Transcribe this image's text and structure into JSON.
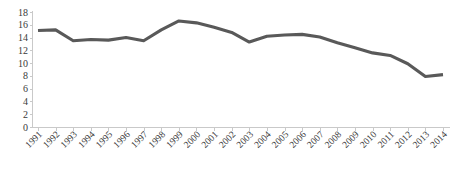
{
  "chart_data": {
    "type": "line",
    "title": "",
    "subtitle": "",
    "xlabel": "",
    "ylabel": "",
    "categories": [
      "1991",
      "1992",
      "1993",
      "1994",
      "1995",
      "1996",
      "1997",
      "1998",
      "1999",
      "2000",
      "2001",
      "2002",
      "2003",
      "2004",
      "2005",
      "2006",
      "2007",
      "2008",
      "2009",
      "2010",
      "2011",
      "2012",
      "2013",
      "2014"
    ],
    "series": [
      {
        "name": "",
        "color": "#595959",
        "values": [
          15.1,
          15.2,
          13.5,
          13.7,
          13.6,
          14.0,
          13.5,
          15.2,
          16.6,
          16.3,
          15.6,
          14.8,
          13.3,
          14.2,
          14.4,
          14.5,
          14.1,
          13.2,
          12.4,
          11.6,
          11.2,
          9.9,
          7.9,
          8.2
        ]
      }
    ],
    "ylim": [
      0,
      18
    ],
    "yticks": [
      0,
      2,
      4,
      6,
      8,
      10,
      12,
      14,
      16,
      18
    ],
    "ytick_labels": [
      "0",
      "2",
      "4",
      "6",
      "8",
      "10",
      "12",
      "14",
      "16",
      "18"
    ],
    "grid": false,
    "legend": "none",
    "xtick_rotation": -45
  },
  "axes": {
    "y_axis_name": "y-axis",
    "x_axis_name": "x-axis"
  }
}
